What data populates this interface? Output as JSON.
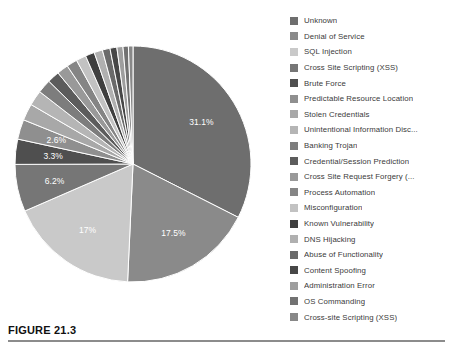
{
  "figure": {
    "caption": "FIGURE 21.3"
  },
  "chart_data": {
    "type": "pie",
    "title": "",
    "legend_position": "right",
    "grid": false,
    "labels_shown_on_slices": [
      "31.1%",
      "17.5%",
      "17%",
      "6.2%",
      "3.3%",
      "2.6%"
    ],
    "categories": [
      "Unknown",
      "Denial of Service",
      "SQL Injection",
      "Cross Site Scripting (XSS)",
      "Brute Force",
      "Predictable Resource Location",
      "Stolen Credentials",
      "Unintentional Information Disc...",
      "Banking Trojan",
      "Credential/Session Prediction",
      "Cross Site Request Forgery (...",
      "Process Automation",
      "Misconfiguration",
      "Known Vulnerability",
      "DNS Hijacking",
      "Abuse of Functionality",
      "Content Spoofing",
      "Administration Error",
      "OS Commanding",
      "Cross-site Scripting (XSS)"
    ],
    "values": [
      31.1,
      17.5,
      17.0,
      6.2,
      3.3,
      2.6,
      2.2,
      2.0,
      1.8,
      1.6,
      1.5,
      1.4,
      1.3,
      1.2,
      1.1,
      1.0,
      0.9,
      0.8,
      0.7,
      0.6
    ],
    "value_labels": [
      "31.1%",
      "17.5%",
      "17%",
      "6.2%",
      "3.3%",
      "2.6%",
      "",
      "",
      "",
      "",
      "",
      "",
      "",
      "",
      "",
      "",
      "",
      "",
      "",
      ""
    ],
    "colors": [
      "#6e6e6e",
      "#8a8a8a",
      "#c9c9c9",
      "#767676",
      "#4f4f4f",
      "#8f8f8f",
      "#a8a8a8",
      "#b5b5b5",
      "#7d7d7d",
      "#5c5c5c",
      "#999999",
      "#858585",
      "#c2c2c2",
      "#3f3f3f",
      "#b0b0b0",
      "#6a6a6a",
      "#474747",
      "#9e9e9e",
      "#727272",
      "#888888"
    ]
  }
}
